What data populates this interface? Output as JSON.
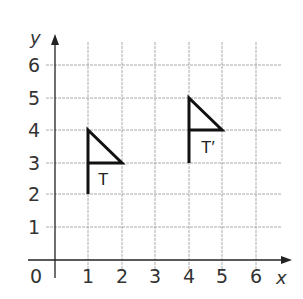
{
  "diagram": {
    "type": "coordinate-grid",
    "x_axis": {
      "label": "x",
      "ticks": [
        "1",
        "2",
        "3",
        "4",
        "5",
        "6"
      ],
      "origin_label": "0"
    },
    "y_axis": {
      "label": "y",
      "ticks": [
        "1",
        "2",
        "3",
        "4",
        "5",
        "6"
      ]
    },
    "shapes": [
      {
        "name": "T",
        "label": "T",
        "points": [
          [
            1,
            2
          ],
          [
            1,
            4
          ],
          [
            2,
            3
          ],
          [
            1,
            3
          ]
        ]
      },
      {
        "name": "T'",
        "label": "T′",
        "points": [
          [
            4,
            3
          ],
          [
            4,
            5
          ],
          [
            5,
            4
          ],
          [
            4,
            4
          ]
        ]
      }
    ],
    "colors": {
      "grid": "#aaaaaa",
      "axis": "#222222",
      "shape": "#111111"
    }
  }
}
